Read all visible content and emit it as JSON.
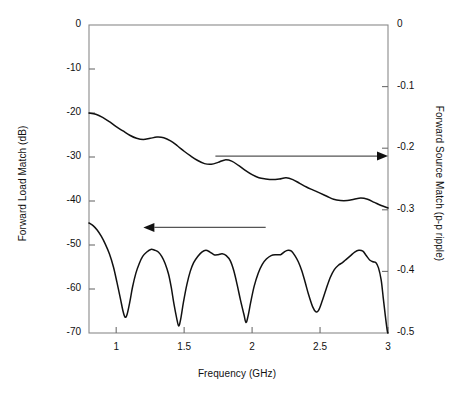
{
  "chart_data": {
    "type": "line",
    "title": "",
    "xlabel": "Frequency (GHz)",
    "ylabel": "Forward Load Match (dB)",
    "y2label": "Forward Source Match (p-p ripple)",
    "xlim": [
      0.8,
      3.0
    ],
    "ylim": [
      -70,
      0
    ],
    "y2lim": [
      -0.5,
      0
    ],
    "grid": false,
    "legend": "none",
    "xticks": [
      1,
      1.5,
      2,
      2.5,
      3
    ],
    "xtick_labels": [
      "1",
      "1.5",
      "2",
      "2.5",
      "3"
    ],
    "yticks": [
      0,
      -10,
      -20,
      -30,
      -40,
      -50,
      -60,
      -70
    ],
    "ytick_labels": [
      "0",
      "-10",
      "-20",
      "-30",
      "-40",
      "-50",
      "-60",
      "-70"
    ],
    "y2ticks": [
      0,
      -0.1,
      -0.2,
      -0.3,
      -0.4,
      -0.5
    ],
    "y2tick_labels": [
      "0",
      "-0.1",
      "-0.2",
      "-0.3",
      "-0.4",
      "-0.5"
    ],
    "annotations": [
      {
        "name": "arrow-to-right-axis",
        "label": "",
        "direction": "right",
        "x_start": 1.73,
        "x_end": 3.0,
        "y": -29.8
      },
      {
        "name": "arrow-to-left-axis",
        "label": "",
        "direction": "left",
        "x_start": 2.1,
        "x_end": 1.2,
        "y": -46.0
      }
    ],
    "series": [
      {
        "name": "Forward Source Match (p-p ripple)",
        "axis": "right",
        "color": "#111111",
        "points": [
          [
            0.8,
            -0.143
          ],
          [
            0.85,
            -0.145
          ],
          [
            0.9,
            -0.15
          ],
          [
            0.95,
            -0.157
          ],
          [
            1.0,
            -0.165
          ],
          [
            1.05,
            -0.172
          ],
          [
            1.1,
            -0.179
          ],
          [
            1.15,
            -0.184
          ],
          [
            1.2,
            -0.186
          ],
          [
            1.25,
            -0.184
          ],
          [
            1.3,
            -0.182
          ],
          [
            1.35,
            -0.183
          ],
          [
            1.4,
            -0.188
          ],
          [
            1.45,
            -0.196
          ],
          [
            1.5,
            -0.205
          ],
          [
            1.55,
            -0.213
          ],
          [
            1.6,
            -0.22
          ],
          [
            1.65,
            -0.225
          ],
          [
            1.7,
            -0.226
          ],
          [
            1.75,
            -0.223
          ],
          [
            1.8,
            -0.219
          ],
          [
            1.85,
            -0.221
          ],
          [
            1.9,
            -0.228
          ],
          [
            1.95,
            -0.236
          ],
          [
            2.0,
            -0.243
          ],
          [
            2.05,
            -0.248
          ],
          [
            2.1,
            -0.25
          ],
          [
            2.15,
            -0.251
          ],
          [
            2.2,
            -0.25
          ],
          [
            2.25,
            -0.248
          ],
          [
            2.3,
            -0.251
          ],
          [
            2.35,
            -0.257
          ],
          [
            2.4,
            -0.263
          ],
          [
            2.45,
            -0.268
          ],
          [
            2.5,
            -0.273
          ],
          [
            2.55,
            -0.278
          ],
          [
            2.6,
            -0.283
          ],
          [
            2.65,
            -0.285
          ],
          [
            2.7,
            -0.285
          ],
          [
            2.75,
            -0.283
          ],
          [
            2.8,
            -0.281
          ],
          [
            2.85,
            -0.283
          ],
          [
            2.9,
            -0.288
          ],
          [
            2.95,
            -0.293
          ],
          [
            3.0,
            -0.297
          ]
        ]
      },
      {
        "name": "Forward Load Match (dB)",
        "axis": "left",
        "color": "#111111",
        "points": [
          [
            0.8,
            -45.0
          ],
          [
            0.83,
            -45.6
          ],
          [
            0.86,
            -46.6
          ],
          [
            0.89,
            -48.0
          ],
          [
            0.92,
            -49.8
          ],
          [
            0.95,
            -52.0
          ],
          [
            0.98,
            -55.0
          ],
          [
            1.005,
            -58.4
          ],
          [
            1.03,
            -62.0
          ],
          [
            1.05,
            -65.0
          ],
          [
            1.065,
            -66.4
          ],
          [
            1.08,
            -65.8
          ],
          [
            1.1,
            -63.0
          ],
          [
            1.12,
            -59.6
          ],
          [
            1.145,
            -56.4
          ],
          [
            1.17,
            -54.2
          ],
          [
            1.195,
            -52.6
          ],
          [
            1.225,
            -51.6
          ],
          [
            1.255,
            -51.0
          ],
          [
            1.285,
            -51.2
          ],
          [
            1.31,
            -51.6
          ],
          [
            1.335,
            -52.6
          ],
          [
            1.36,
            -54.2
          ],
          [
            1.385,
            -56.6
          ],
          [
            1.405,
            -59.6
          ],
          [
            1.425,
            -63.4
          ],
          [
            1.445,
            -66.6
          ],
          [
            1.46,
            -68.4
          ],
          [
            1.475,
            -66.8
          ],
          [
            1.495,
            -63.0
          ],
          [
            1.52,
            -59.0
          ],
          [
            1.545,
            -56.0
          ],
          [
            1.57,
            -54.0
          ],
          [
            1.6,
            -52.6
          ],
          [
            1.63,
            -51.6
          ],
          [
            1.66,
            -51.2
          ],
          [
            1.69,
            -51.6
          ],
          [
            1.72,
            -52.2
          ],
          [
            1.75,
            -52.2
          ],
          [
            1.78,
            -52.0
          ],
          [
            1.81,
            -52.4
          ],
          [
            1.84,
            -53.6
          ],
          [
            1.865,
            -55.8
          ],
          [
            1.89,
            -59.0
          ],
          [
            1.915,
            -62.6
          ],
          [
            1.94,
            -65.8
          ],
          [
            1.955,
            -67.6
          ],
          [
            1.97,
            -66.2
          ],
          [
            1.99,
            -63.0
          ],
          [
            2.015,
            -59.4
          ],
          [
            2.045,
            -56.4
          ],
          [
            2.075,
            -54.4
          ],
          [
            2.105,
            -53.2
          ],
          [
            2.14,
            -52.4
          ],
          [
            2.175,
            -52.2
          ],
          [
            2.21,
            -52.2
          ],
          [
            2.24,
            -51.5
          ],
          [
            2.265,
            -51.2
          ],
          [
            2.29,
            -51.4
          ],
          [
            2.315,
            -52.4
          ],
          [
            2.34,
            -53.8
          ],
          [
            2.365,
            -55.8
          ],
          [
            2.39,
            -58.4
          ],
          [
            2.415,
            -61.2
          ],
          [
            2.445,
            -64.0
          ],
          [
            2.47,
            -65.2
          ],
          [
            2.49,
            -64.8
          ],
          [
            2.515,
            -62.8
          ],
          [
            2.545,
            -60.0
          ],
          [
            2.575,
            -57.4
          ],
          [
            2.605,
            -55.6
          ],
          [
            2.635,
            -54.6
          ],
          [
            2.665,
            -54.0
          ],
          [
            2.695,
            -53.2
          ],
          [
            2.725,
            -52.4
          ],
          [
            2.755,
            -51.6
          ],
          [
            2.785,
            -51.2
          ],
          [
            2.815,
            -51.4
          ],
          [
            2.84,
            -52.4
          ],
          [
            2.865,
            -53.4
          ],
          [
            2.89,
            -53.8
          ],
          [
            2.91,
            -54.0
          ],
          [
            2.93,
            -55.2
          ],
          [
            2.95,
            -58.0
          ],
          [
            2.965,
            -62.0
          ],
          [
            2.98,
            -66.0
          ],
          [
            2.995,
            -69.6
          ],
          [
            3.0,
            -70.0
          ]
        ]
      }
    ]
  },
  "axes": {
    "left_title": "Forward Load Match (dB)",
    "right_title": "Forward Source Match (p-p ripple)",
    "bottom_title": "Frequency (GHz)"
  }
}
